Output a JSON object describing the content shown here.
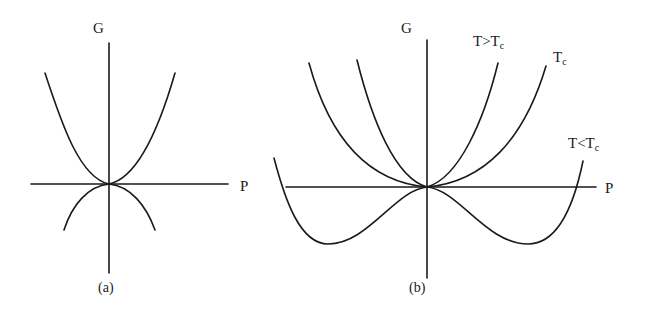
{
  "figure": {
    "panel_a": {
      "caption": "(a)",
      "y_axis_label": "G",
      "x_axis_label": "P",
      "curves": [
        {
          "name": "upward-parabola",
          "shape": "convex, minimum at origin"
        },
        {
          "name": "downward-parabola",
          "shape": "concave, maximum at origin"
        }
      ]
    },
    "panel_b": {
      "caption": "(b)",
      "y_axis_label": "G",
      "x_axis_label": "P",
      "curves": [
        {
          "label_main": "T>T",
          "label_sub": "c",
          "shape": "single minimum at P=0 (steep)"
        },
        {
          "label_main": "T",
          "label_sub": "c",
          "shape": "flat single minimum at P=0 (quartic)"
        },
        {
          "label_main": "T<T",
          "label_sub": "c",
          "shape": "double-well, local max at P=0, two minima"
        }
      ]
    },
    "colors": {
      "line": "#1a1a1a",
      "background": "#ffffff"
    }
  }
}
